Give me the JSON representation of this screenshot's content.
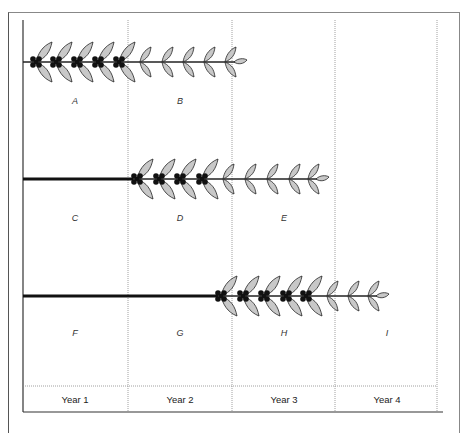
{
  "diagram": {
    "title": "",
    "years": [
      {
        "label": "Year 1",
        "x": 75
      },
      {
        "label": "Year 2",
        "x": 180
      },
      {
        "label": "Year 3",
        "x": 284
      },
      {
        "label": "Year 4",
        "x": 387
      }
    ],
    "segment_labels": [
      {
        "id": "A",
        "x": 75,
        "y": 96
      },
      {
        "id": "B",
        "x": 180,
        "y": 96
      },
      {
        "id": "C",
        "x": 75,
        "y": 213
      },
      {
        "id": "D",
        "x": 180,
        "y": 213
      },
      {
        "id": "E",
        "x": 284,
        "y": 213
      },
      {
        "id": "F",
        "x": 75,
        "y": 328
      },
      {
        "id": "G",
        "x": 180,
        "y": 328
      },
      {
        "id": "H",
        "x": 284,
        "y": 328
      },
      {
        "id": "I",
        "x": 387,
        "y": 328
      }
    ],
    "shoots": [
      {
        "row": 1,
        "y": 62,
        "bare_from": 23,
        "bare_to": 23,
        "fruiting_nodes_x": [
          36,
          56,
          77,
          98,
          119
        ],
        "leafy_nodes_x": [
          140,
          162,
          183,
          204,
          225
        ],
        "tip_x": 240
      },
      {
        "row": 2,
        "y": 179,
        "bare_from": 23,
        "bare_to": 133,
        "fruiting_nodes_x": [
          137,
          159,
          180,
          202
        ],
        "leafy_nodes_x": [
          223,
          245,
          267,
          289,
          308
        ],
        "tip_x": 322
      },
      {
        "row": 3,
        "y": 296,
        "bare_from": 23,
        "bare_to": 218,
        "fruiting_nodes_x": [
          221,
          243,
          264,
          286,
          306
        ],
        "leafy_nodes_x": [
          327,
          348,
          368
        ],
        "tip_x": 382
      }
    ],
    "colors": {
      "leaf_fill": "#c8c8c8",
      "stroke": "#222222",
      "berry": "#111111",
      "grid": "#888888"
    }
  }
}
